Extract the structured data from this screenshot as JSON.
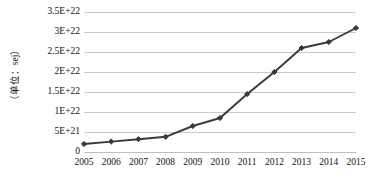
{
  "chart_data": {
    "type": "line",
    "title": "",
    "xlabel": "",
    "ylabel": "（单位：sej）",
    "categories": [
      "2005",
      "2006",
      "2007",
      "2008",
      "2009",
      "2010",
      "2011",
      "2012",
      "2013",
      "2014",
      "2015"
    ],
    "values": [
      2e+21,
      2.6e+21,
      3.2e+21,
      3.8e+21,
      6.5e+21,
      8.5e+21,
      1.45e+22,
      2e+22,
      2.6e+22,
      2.75e+22,
      3.1e+22
    ],
    "series": [
      {
        "name": "",
        "values": [
          2e+21,
          2.6e+21,
          3.2e+21,
          3.8e+21,
          6.5e+21,
          8.5e+21,
          1.45e+22,
          2e+22,
          2.6e+22,
          2.75e+22,
          3.1e+22
        ]
      }
    ],
    "ylim": [
      0,
      3.5e+22
    ],
    "y_ticks": [
      0,
      5e+21,
      1e+22,
      1.5e+22,
      2e+22,
      2.5e+22,
      3e+22,
      3.5e+22
    ],
    "y_tick_labels": [
      "0",
      "5E+21",
      "1E+22",
      "1.5E+22",
      "2E+22",
      "2.5E+22",
      "3E+22",
      "3.5E+22"
    ],
    "grid": true,
    "grid_axis": "y",
    "legend": "none",
    "marker": "diamond",
    "line_color": "#3a3a3a",
    "marker_color": "#3a3a3a",
    "grid_color": "#c9c9c9",
    "text_color": "#111111",
    "background": "#ffffff"
  }
}
